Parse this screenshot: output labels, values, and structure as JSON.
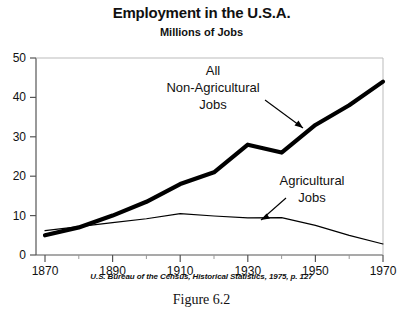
{
  "figure": {
    "title": "Employment in the U.S.A.",
    "subtitle": "Millions of Jobs",
    "source": "U.S. Bureau of the Census, Historical Statistics, 1975, p. 127",
    "caption": "Figure 6.2"
  },
  "annotations": {
    "nonag": {
      "line1": "All",
      "line2": "Non-Agricultural",
      "line3": "Jobs"
    },
    "ag": {
      "line1": "Agricultural",
      "line2": "Jobs"
    }
  },
  "axis": {
    "y_ticks": [
      "0",
      "10",
      "20",
      "30",
      "40",
      "50"
    ],
    "x_ticks": [
      "1870",
      "1890",
      "1910",
      "1930",
      "1950",
      "1970"
    ]
  },
  "colors": {
    "line": "#000000",
    "axis": "#555555",
    "background": "#ffffff"
  },
  "chart_data": {
    "type": "line",
    "title": "Employment in the U.S.A.",
    "subtitle": "Millions of Jobs",
    "xlabel": "",
    "ylabel": "Millions of Jobs",
    "xlim": [
      1870,
      1970
    ],
    "ylim": [
      0,
      50
    ],
    "xticks": [
      1870,
      1890,
      1910,
      1930,
      1950,
      1970
    ],
    "yticks": [
      0,
      10,
      20,
      30,
      40,
      50
    ],
    "minor_xticks": [
      1880,
      1900,
      1920,
      1940,
      1960
    ],
    "grid": false,
    "legend": "annotated-inline",
    "x": [
      1870,
      1880,
      1890,
      1900,
      1910,
      1920,
      1930,
      1940,
      1950,
      1960,
      1970
    ],
    "series": [
      {
        "name": "All Non-Agricultural Jobs",
        "style": "thick",
        "values": [
          5,
          7,
          10,
          13.5,
          18,
          21,
          28,
          26,
          33,
          38,
          44
        ]
      },
      {
        "name": "Agricultural Jobs",
        "style": "thin",
        "values": [
          6.2,
          7.2,
          8.2,
          9.2,
          10.5,
          9.9,
          9.4,
          9.5,
          7.5,
          5,
          2.8
        ]
      }
    ],
    "source": "U.S. Bureau of the Census, Historical Statistics, 1975, p. 127"
  }
}
